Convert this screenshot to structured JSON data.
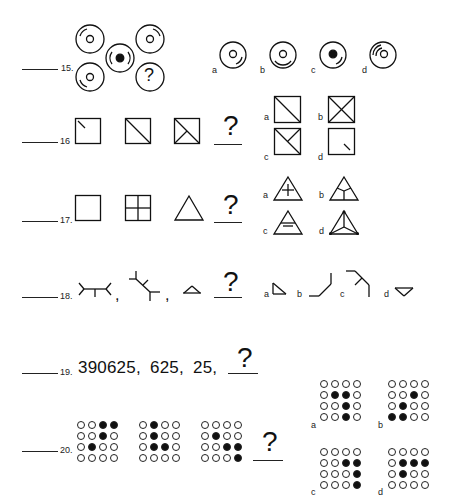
{
  "questions": [
    {
      "number": "15.",
      "type": "figure-matrix",
      "description": "Five overlapping circles: four outer circles with small ring and arc, center circle with filled dot; bottom-right circle contains question mark",
      "question_mark": "?",
      "options": [
        {
          "label": "a",
          "description": "circle with small ring, arc at lower right"
        },
        {
          "label": "b",
          "description": "circle with small ring, arc at bottom"
        },
        {
          "label": "c",
          "description": "circle with filled dot, arc at lower right"
        },
        {
          "label": "d",
          "description": "circle with small ring, double arc at upper left"
        }
      ]
    },
    {
      "number": "16",
      "type": "figure-sequence",
      "sequence": [
        "square with short diagonal from top-left",
        "square with full diagonal",
        "square with diagonal and half counter-diagonal"
      ],
      "question_mark": "?",
      "options": [
        {
          "label": "a",
          "description": "square with full diagonal"
        },
        {
          "label": "b",
          "description": "square with both diagonals (X)"
        },
        {
          "label": "c",
          "description": "square with diagonal and half counter-diagonal from top-right"
        },
        {
          "label": "d",
          "description": "square with short segment near bottom-right"
        }
      ]
    },
    {
      "number": "17.",
      "type": "figure-analogy",
      "sequence": [
        "empty square",
        "square divided into four",
        "empty triangle"
      ],
      "question_mark": "?",
      "options": [
        {
          "label": "a",
          "description": "triangle with plus sign inside"
        },
        {
          "label": "b",
          "description": "triangle with Y-shaped division"
        },
        {
          "label": "c",
          "description": "triangle with two horizontal lines"
        },
        {
          "label": "d",
          "description": "triangle with lines from center to vertices"
        }
      ]
    },
    {
      "number": "18.",
      "type": "figure-sequence",
      "sequence": [
        "branching line figure",
        "rotated branching figure",
        "small open triangle"
      ],
      "separator": ",",
      "question_mark": "?",
      "options": [
        {
          "label": "a",
          "description": "small right-angle triangle"
        },
        {
          "label": "b",
          "description": "angled line path"
        },
        {
          "label": "c",
          "description": "branching angled line"
        },
        {
          "label": "d",
          "description": "small inverted triangle"
        }
      ]
    },
    {
      "number": "19.",
      "type": "number-sequence",
      "sequence": [
        "390625,",
        "625,",
        "25,"
      ],
      "question_mark": "?"
    },
    {
      "number": "20.",
      "type": "dot-matrix",
      "sequence_grids": [
        [
          [
            0,
            0,
            1,
            1
          ],
          [
            0,
            0,
            1,
            0
          ],
          [
            0,
            1,
            0,
            0
          ],
          [
            0,
            0,
            0,
            0
          ]
        ],
        [
          [
            0,
            1,
            0,
            0
          ],
          [
            0,
            1,
            0,
            0
          ],
          [
            0,
            1,
            1,
            0
          ],
          [
            0,
            0,
            0,
            0
          ]
        ],
        [
          [
            0,
            0,
            0,
            0
          ],
          [
            0,
            1,
            0,
            0
          ],
          [
            0,
            0,
            1,
            1
          ],
          [
            0,
            0,
            0,
            1
          ]
        ]
      ],
      "question_mark": "?",
      "options": [
        {
          "label": "a",
          "grid": [
            [
              0,
              0,
              0,
              0
            ],
            [
              0,
              1,
              1,
              0
            ],
            [
              0,
              0,
              1,
              0
            ],
            [
              0,
              0,
              1,
              0
            ]
          ]
        },
        {
          "label": "b",
          "grid": [
            [
              0,
              0,
              0,
              0
            ],
            [
              0,
              0,
              1,
              0
            ],
            [
              0,
              1,
              0,
              0
            ],
            [
              1,
              1,
              0,
              0
            ]
          ]
        },
        {
          "label": "c",
          "grid": [
            [
              0,
              0,
              0,
              0
            ],
            [
              0,
              0,
              1,
              1
            ],
            [
              0,
              0,
              0,
              1
            ],
            [
              0,
              0,
              0,
              1
            ]
          ]
        },
        {
          "label": "d",
          "grid": [
            [
              0,
              0,
              0,
              0
            ],
            [
              0,
              1,
              1,
              1
            ],
            [
              0,
              1,
              0,
              0
            ],
            [
              0,
              0,
              0,
              0
            ]
          ]
        }
      ]
    }
  ]
}
